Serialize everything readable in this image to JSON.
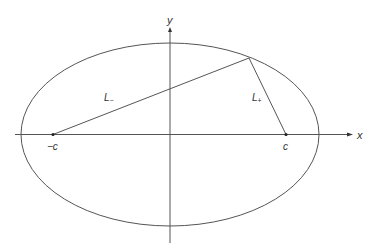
{
  "diagram": {
    "type": "ellipse-foci",
    "colors": {
      "stroke": "#555555",
      "text": "#333333",
      "background": "#ffffff"
    },
    "axes": {
      "x_label": "x",
      "y_label": "y"
    },
    "foci": {
      "left_label": "−c",
      "right_label": "c"
    },
    "segments": {
      "left_label": "L",
      "left_sub": "−",
      "right_label": "L",
      "right_sub": "+"
    }
  }
}
